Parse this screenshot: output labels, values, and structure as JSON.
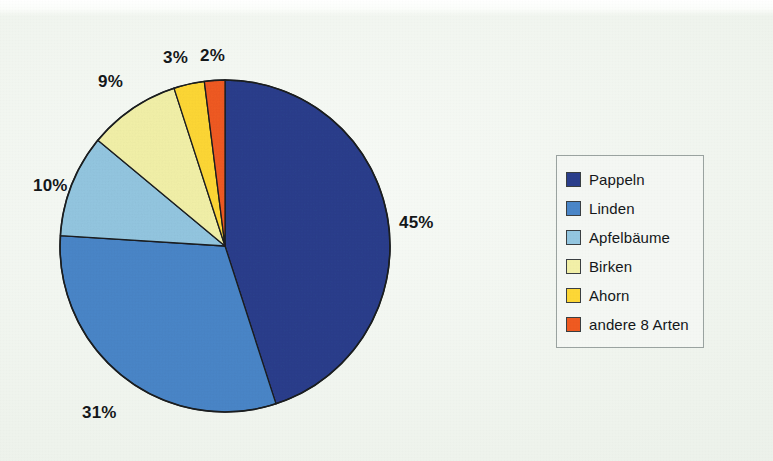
{
  "page": {
    "background_color": "#f1f5f0",
    "caption_fragment": ""
  },
  "chart_data": {
    "type": "pie",
    "title": "",
    "xlabel": "",
    "ylabel": "",
    "unit": "%",
    "start_angle_deg": 0,
    "direction": "clockwise",
    "legend_position": "right",
    "grid": false,
    "categories": [
      "Pappeln",
      "Linden",
      "Apfelbäume",
      "Birken",
      "Ahorn",
      "andere 8 Arten"
    ],
    "values": [
      45,
      31,
      10,
      9,
      3,
      2
    ],
    "value_labels": [
      "45%",
      "31%",
      "10%",
      "9%",
      "3%",
      "2%"
    ],
    "colors": [
      "#2b3f8c",
      "#4a86c8",
      "#93c6e0",
      "#f2f0a8",
      "#fdd736",
      "#ef5a21"
    ],
    "slices": [
      {
        "label": "Pappeln",
        "value": 45,
        "value_label": "45%",
        "color": "#2b3f8c"
      },
      {
        "label": "Linden",
        "value": 31,
        "value_label": "31%",
        "color": "#4a86c8"
      },
      {
        "label": "Apfelbäume",
        "value": 10,
        "value_label": "10%",
        "color": "#93c6e0"
      },
      {
        "label": "Birken",
        "value": 9,
        "value_label": "9%",
        "color": "#f2f0a8"
      },
      {
        "label": "Ahorn",
        "value": 3,
        "value_label": "3%",
        "color": "#fdd736"
      },
      {
        "label": "andere 8 Arten",
        "value": 2,
        "value_label": "2%",
        "color": "#ef5a21"
      }
    ]
  },
  "legend": {
    "border_color": "#9aa3a0",
    "items": [
      {
        "label": "Pappeln",
        "color": "#2b3f8c"
      },
      {
        "label": "Linden",
        "color": "#4a86c8"
      },
      {
        "label": "Apfelbäume",
        "color": "#93c6e0"
      },
      {
        "label": "Birken",
        "color": "#f2f0a8"
      },
      {
        "label": "Ahorn",
        "color": "#fdd736"
      },
      {
        "label": "andere 8 Arten",
        "color": "#ef5a21"
      }
    ]
  },
  "labels": {
    "pappeln_pct": "45%",
    "linden_pct": "31%",
    "apfelbaeume_pct": "10%",
    "birken_pct": "9%",
    "ahorn_pct": "3%",
    "andere_pct": "2%"
  }
}
